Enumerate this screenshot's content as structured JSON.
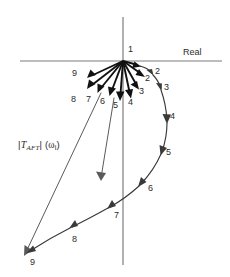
{
  "figure": {
    "axes": {
      "real_label": "Real",
      "real_axis_y": 61,
      "real_axis_x_start": 20,
      "real_axis_x_end": 222,
      "imag_axis_x": 123,
      "imag_axis_y_start": 17,
      "imag_axis_y_end": 265,
      "axis_color": "#7d7d7d"
    },
    "magnitude_label": {
      "text": "|TAFT| (ω)",
      "symbol": "T",
      "subscript": "AFT",
      "argument": "ω"
    },
    "vectors": {
      "origin_x": 123,
      "origin_y": 61,
      "color": "#111111",
      "items": [
        {
          "label": "1",
          "tip_x": 140,
          "tip_y": 66,
          "label_x": 128,
          "label_y": 51
        },
        {
          "label": "2",
          "tip_x": 144,
          "tip_y": 76,
          "label_x": 146,
          "label_y": 79
        },
        {
          "label": "3",
          "tip_x": 139,
          "tip_y": 88,
          "label_x": 140,
          "label_y": 91
        },
        {
          "label": "4",
          "tip_x": 131,
          "tip_y": 97,
          "label_x": 129,
          "label_y": 100
        },
        {
          "label": "5",
          "tip_x": 120,
          "tip_y": 100,
          "label_x": 112,
          "label_y": 102
        },
        {
          "label": "6",
          "tip_x": 110,
          "tip_y": 96,
          "label_x": 102,
          "label_y": 98
        },
        {
          "label": "7",
          "tip_x": 98,
          "tip_y": 93,
          "label_x": 89,
          "label_y": 95
        },
        {
          "label": "8",
          "tip_x": 88,
          "tip_y": 89,
          "label_x": 76,
          "label_y": 92
        },
        {
          "label": "9",
          "tip_x": 88,
          "tip_y": 78,
          "label_x": 76,
          "label_y": 72
        }
      ]
    },
    "locus": {
      "color": "#3a3a3a",
      "description": "outer curved locus traced through arrow tips",
      "points": [
        {
          "x": 141,
          "y": 67
        },
        {
          "x": 152,
          "y": 73
        },
        {
          "x": 160,
          "y": 86
        },
        {
          "x": 166,
          "y": 104
        },
        {
          "x": 168,
          "y": 124
        },
        {
          "x": 163,
          "y": 146
        },
        {
          "x": 152,
          "y": 167
        },
        {
          "x": 136,
          "y": 187
        },
        {
          "x": 112,
          "y": 208
        },
        {
          "x": 82,
          "y": 228
        },
        {
          "x": 50,
          "y": 245
        },
        {
          "x": 26,
          "y": 256
        }
      ],
      "arrow_labels": [
        {
          "label": "2",
          "x": 155,
          "y": 72
        },
        {
          "label": "3",
          "x": 163,
          "y": 87
        },
        {
          "label": "4",
          "x": 170,
          "y": 117
        },
        {
          "label": "5",
          "x": 165,
          "y": 153
        },
        {
          "label": "6",
          "x": 148,
          "y": 189
        },
        {
          "label": "7",
          "x": 113,
          "y": 215
        },
        {
          "label": "8",
          "x": 72,
          "y": 240
        },
        {
          "label": "9",
          "x": 32,
          "y": 262
        }
      ]
    },
    "thin_vectors": {
      "color": "#5a5a5a",
      "items": [
        {
          "name": "long-vector-to-lower-left",
          "x1": 101,
          "y1": 93,
          "x2": 24,
          "y2": 254
        },
        {
          "name": "long-vector-downward",
          "x1": 114,
          "y1": 98,
          "x2": 101,
          "y2": 180
        }
      ]
    }
  }
}
